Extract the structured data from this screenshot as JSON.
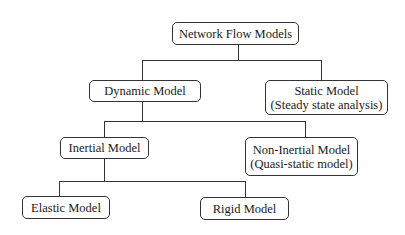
{
  "diagram": {
    "type": "tree",
    "title": "Network Flow Models",
    "nodes": {
      "root": {
        "lines": [
          "Network Flow Models"
        ]
      },
      "dynamic": {
        "lines": [
          "Dynamic Model"
        ]
      },
      "static": {
        "lines": [
          "Static Model",
          "(Steady state analysis)"
        ]
      },
      "inertial": {
        "lines": [
          "Inertial Model"
        ]
      },
      "non_inertial": {
        "lines": [
          "Non-Inertial Model",
          "(Quasi-static model)"
        ]
      },
      "elastic": {
        "lines": [
          "Elastic Model"
        ]
      },
      "rigid": {
        "lines": [
          "Rigid Model"
        ]
      }
    },
    "edges": [
      {
        "from": "Network Flow Models",
        "to": "Dynamic Model"
      },
      {
        "from": "Network Flow Models",
        "to": "Static Model"
      },
      {
        "from": "Dynamic Model",
        "to": "Inertial Model"
      },
      {
        "from": "Dynamic Model",
        "to": "Non-Inertial Model"
      },
      {
        "from": "Inertial Model",
        "to": "Elastic Model"
      },
      {
        "from": "Inertial Model",
        "to": "Rigid Model"
      }
    ]
  }
}
